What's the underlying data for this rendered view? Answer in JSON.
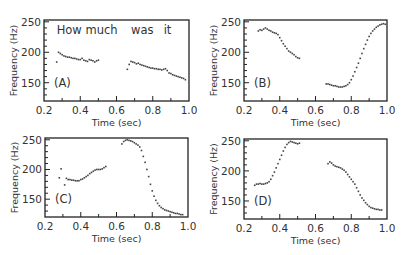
{
  "chart_data": [
    {
      "type": "scatter",
      "panel": "(A)",
      "xlabel": "Time (sec)",
      "ylabel": "Frequency (Hz)",
      "xlim": [
        0.2,
        1.0
      ],
      "ylim": [
        120,
        253
      ],
      "xticks": [
        "0.2",
        "0.4",
        "0.6",
        "0.8",
        "1.0"
      ],
      "yticks": [
        "150",
        "200",
        "250"
      ],
      "annotations": [
        {
          "text": "How much",
          "x": 0.27,
          "y": 230
        },
        {
          "text": "was",
          "x": 0.68,
          "y": 230
        },
        {
          "text": "it",
          "x": 0.86,
          "y": 230
        }
      ],
      "series": [
        {
          "name": "pitch",
          "points": [
            [
              0.27,
              184
            ],
            [
              0.28,
              200
            ],
            [
              0.29,
              198
            ],
            [
              0.3,
              196
            ],
            [
              0.31,
              194
            ],
            [
              0.32,
              193
            ],
            [
              0.33,
              192
            ],
            [
              0.34,
              192
            ],
            [
              0.35,
              191
            ],
            [
              0.36,
              190
            ],
            [
              0.37,
              190
            ],
            [
              0.38,
              189
            ],
            [
              0.39,
              188
            ],
            [
              0.4,
              188
            ],
            [
              0.41,
              190
            ],
            [
              0.42,
              187
            ],
            [
              0.43,
              186
            ],
            [
              0.44,
              185
            ],
            [
              0.45,
              188
            ],
            [
              0.46,
              187
            ],
            [
              0.47,
              186
            ],
            [
              0.48,
              184
            ],
            [
              0.49,
              186
            ],
            [
              0.5,
              187
            ],
            [
              0.66,
              172
            ],
            [
              0.67,
              180
            ],
            [
              0.68,
              185
            ],
            [
              0.69,
              184
            ],
            [
              0.7,
              183
            ],
            [
              0.71,
              181
            ],
            [
              0.72,
              182
            ],
            [
              0.73,
              180
            ],
            [
              0.74,
              179
            ],
            [
              0.75,
              178
            ],
            [
              0.76,
              177
            ],
            [
              0.77,
              176
            ],
            [
              0.78,
              175
            ],
            [
              0.79,
              174
            ],
            [
              0.8,
              174
            ],
            [
              0.81,
              173
            ],
            [
              0.82,
              173
            ],
            [
              0.83,
              172
            ],
            [
              0.84,
              172
            ],
            [
              0.85,
              171
            ],
            [
              0.86,
              172
            ],
            [
              0.87,
              173
            ],
            [
              0.88,
              170
            ],
            [
              0.89,
              166
            ],
            [
              0.9,
              165
            ],
            [
              0.91,
              163
            ],
            [
              0.92,
              162
            ],
            [
              0.93,
              161
            ],
            [
              0.94,
              160
            ],
            [
              0.95,
              159
            ],
            [
              0.96,
              158
            ],
            [
              0.97,
              157
            ],
            [
              0.98,
              155
            ]
          ]
        }
      ]
    },
    {
      "type": "scatter",
      "panel": "(B)",
      "xlabel": "Time (sec)",
      "ylabel": "Frequency (Hz)",
      "xlim": [
        0.2,
        1.0
      ],
      "ylim": [
        120,
        253
      ],
      "xticks": [
        "0.2",
        "0.4",
        "0.6",
        "0.8",
        "1.0"
      ],
      "yticks": [
        "150",
        "200",
        "250"
      ],
      "annotations": [],
      "series": [
        {
          "name": "pitch",
          "points": [
            [
              0.28,
              235
            ],
            [
              0.29,
              237
            ],
            [
              0.3,
              236
            ],
            [
              0.31,
              238
            ],
            [
              0.32,
              240
            ],
            [
              0.33,
              238
            ],
            [
              0.34,
              236
            ],
            [
              0.35,
              235
            ],
            [
              0.36,
              233
            ],
            [
              0.37,
              232
            ],
            [
              0.38,
              231
            ],
            [
              0.39,
              229
            ],
            [
              0.4,
              224
            ],
            [
              0.41,
              219
            ],
            [
              0.42,
              214
            ],
            [
              0.43,
              210
            ],
            [
              0.44,
              206
            ],
            [
              0.45,
              202
            ],
            [
              0.46,
              200
            ],
            [
              0.47,
              198
            ],
            [
              0.48,
              196
            ],
            [
              0.49,
              193
            ],
            [
              0.5,
              191
            ],
            [
              0.51,
              190
            ],
            [
              0.66,
              148
            ],
            [
              0.67,
              148
            ],
            [
              0.68,
              147
            ],
            [
              0.69,
              146
            ],
            [
              0.7,
              145
            ],
            [
              0.71,
              145
            ],
            [
              0.72,
              144
            ],
            [
              0.73,
              143
            ],
            [
              0.74,
              143
            ],
            [
              0.75,
              143
            ],
            [
              0.76,
              144
            ],
            [
              0.77,
              145
            ],
            [
              0.78,
              147
            ],
            [
              0.79,
              150
            ],
            [
              0.8,
              155
            ],
            [
              0.81,
              161
            ],
            [
              0.82,
              168
            ],
            [
              0.83,
              175
            ],
            [
              0.84,
              182
            ],
            [
              0.85,
              190
            ],
            [
              0.86,
              198
            ],
            [
              0.87,
              206
            ],
            [
              0.88,
              213
            ],
            [
              0.89,
              220
            ],
            [
              0.9,
              226
            ],
            [
              0.91,
              231
            ],
            [
              0.92,
              235
            ],
            [
              0.93,
              238
            ],
            [
              0.94,
              241
            ],
            [
              0.95,
              243
            ],
            [
              0.96,
              245
            ],
            [
              0.97,
              246
            ],
            [
              0.98,
              247
            ],
            [
              0.99,
              246
            ]
          ]
        }
      ]
    },
    {
      "type": "scatter",
      "panel": "(C)",
      "xlabel": "Time (sec)",
      "ylabel": "Frequency (Hz)",
      "xlim": [
        0.2,
        1.0
      ],
      "ylim": [
        120,
        253
      ],
      "xticks": [
        "0.2",
        "0.4",
        "0.6",
        "0.8",
        "1.0"
      ],
      "yticks": [
        "150",
        "200",
        "250"
      ],
      "annotations": [],
      "series": [
        {
          "name": "pitch",
          "points": [
            [
              0.28,
              186
            ],
            [
              0.29,
              201
            ],
            [
              0.31,
              174
            ],
            [
              0.32,
              185
            ],
            [
              0.33,
              183
            ],
            [
              0.34,
              183
            ],
            [
              0.35,
              182
            ],
            [
              0.36,
              182
            ],
            [
              0.37,
              181
            ],
            [
              0.38,
              181
            ],
            [
              0.39,
              181
            ],
            [
              0.4,
              183
            ],
            [
              0.41,
              184
            ],
            [
              0.42,
              186
            ],
            [
              0.43,
              188
            ],
            [
              0.44,
              190
            ],
            [
              0.45,
              193
            ],
            [
              0.46,
              195
            ],
            [
              0.47,
              197
            ],
            [
              0.48,
              199
            ],
            [
              0.49,
              200
            ],
            [
              0.5,
              200
            ],
            [
              0.51,
              200
            ],
            [
              0.52,
              201
            ],
            [
              0.53,
              203
            ],
            [
              0.54,
              205
            ],
            [
              0.63,
              243
            ],
            [
              0.64,
              247
            ],
            [
              0.65,
              249
            ],
            [
              0.66,
              250
            ],
            [
              0.67,
              249
            ],
            [
              0.68,
              248
            ],
            [
              0.69,
              247
            ],
            [
              0.7,
              245
            ],
            [
              0.71,
              243
            ],
            [
              0.72,
              241
            ],
            [
              0.73,
              238
            ],
            [
              0.74,
              232
            ],
            [
              0.75,
              222
            ],
            [
              0.76,
              212
            ],
            [
              0.77,
              200
            ],
            [
              0.78,
              188
            ],
            [
              0.79,
              175
            ],
            [
              0.8,
              164
            ],
            [
              0.81,
              155
            ],
            [
              0.82,
              148
            ],
            [
              0.83,
              143
            ],
            [
              0.84,
              139
            ],
            [
              0.85,
              136
            ],
            [
              0.86,
              134
            ],
            [
              0.87,
              132
            ],
            [
              0.88,
              131
            ],
            [
              0.89,
              130
            ],
            [
              0.9,
              129
            ],
            [
              0.91,
              128
            ],
            [
              0.92,
              127
            ],
            [
              0.93,
              126
            ],
            [
              0.94,
              126
            ],
            [
              0.95,
              125
            ],
            [
              0.96,
              124
            ],
            [
              0.97,
              124
            ]
          ]
        }
      ]
    },
    {
      "type": "scatter",
      "panel": "(D)",
      "xlabel": "Time (sec)",
      "ylabel": "Frequency (Hz)",
      "xlim": [
        0.2,
        1.0
      ],
      "ylim": [
        120,
        253
      ],
      "xticks": [
        "0.2",
        "0.4",
        "0.6",
        "0.8",
        "1.0"
      ],
      "yticks": [
        "150",
        "200",
        "250"
      ],
      "annotations": [],
      "series": [
        {
          "name": "pitch",
          "points": [
            [
              0.26,
              176
            ],
            [
              0.27,
              178
            ],
            [
              0.28,
              178
            ],
            [
              0.29,
              179
            ],
            [
              0.3,
              178
            ],
            [
              0.31,
              178
            ],
            [
              0.32,
              179
            ],
            [
              0.33,
              180
            ],
            [
              0.34,
              182
            ],
            [
              0.35,
              186
            ],
            [
              0.36,
              192
            ],
            [
              0.37,
              198
            ],
            [
              0.38,
              205
            ],
            [
              0.39,
              212
            ],
            [
              0.4,
              219
            ],
            [
              0.41,
              226
            ],
            [
              0.42,
              233
            ],
            [
              0.43,
              239
            ],
            [
              0.44,
              244
            ],
            [
              0.45,
              247
            ],
            [
              0.46,
              249
            ],
            [
              0.47,
              248
            ],
            [
              0.48,
              247
            ],
            [
              0.49,
              246
            ],
            [
              0.5,
              245
            ],
            [
              0.51,
              246
            ],
            [
              0.67,
              212
            ],
            [
              0.68,
              215
            ],
            [
              0.69,
              213
            ],
            [
              0.7,
              210
            ],
            [
              0.71,
              208
            ],
            [
              0.72,
              207
            ],
            [
              0.73,
              206
            ],
            [
              0.74,
              205
            ],
            [
              0.75,
              203
            ],
            [
              0.76,
              201
            ],
            [
              0.77,
              198
            ],
            [
              0.78,
              194
            ],
            [
              0.79,
              190
            ],
            [
              0.8,
              186
            ],
            [
              0.81,
              182
            ],
            [
              0.82,
              178
            ],
            [
              0.83,
              172
            ],
            [
              0.84,
              166
            ],
            [
              0.85,
              160
            ],
            [
              0.86,
              155
            ],
            [
              0.87,
              151
            ],
            [
              0.88,
              147
            ],
            [
              0.89,
              144
            ],
            [
              0.9,
              141
            ],
            [
              0.91,
              139
            ],
            [
              0.92,
              138
            ],
            [
              0.93,
              137
            ],
            [
              0.94,
              136
            ],
            [
              0.95,
              136
            ],
            [
              0.96,
              135
            ],
            [
              0.97,
              135
            ]
          ]
        }
      ]
    }
  ]
}
